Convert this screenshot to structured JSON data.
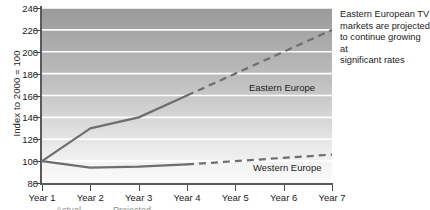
{
  "chart_data": {
    "type": "line",
    "title": "",
    "xlabel": "",
    "ylabel": "Index to 2000 = 100",
    "x": [
      "Year 1",
      "Year 2",
      "Year 3",
      "Year 4",
      "Year 5",
      "Year 6",
      "Year 7"
    ],
    "ylim": [
      80,
      240
    ],
    "yticks": [
      80,
      100,
      120,
      140,
      160,
      180,
      200,
      220,
      240
    ],
    "ytick_labels": [
      "80",
      "100",
      "120",
      "140",
      "160",
      "180",
      "200",
      "220",
      "240"
    ],
    "grid": "horizontal-white-gridlines",
    "legend": "inline-series-labels",
    "series": [
      {
        "name": "Eastern Europe",
        "values": [
          100,
          130,
          140,
          160,
          180,
          200,
          220
        ],
        "actual_through": "Year 4",
        "actual_values": [
          100,
          130,
          140,
          160
        ],
        "projected_values": [
          160,
          180,
          200,
          220
        ],
        "color": "#6e6e6e"
      },
      {
        "name": "Western Europe",
        "values": [
          100,
          94,
          95,
          97,
          100,
          103,
          106
        ],
        "actual_through": "Year 4",
        "actual_values": [
          100,
          94,
          95,
          97
        ],
        "projected_values": [
          97,
          100,
          103,
          106
        ],
        "color": "#6e6e6e"
      }
    ],
    "annotations": [
      {
        "name": "eastern-europe-projection-note",
        "text": "Eastern European TV markets are projected to continue growing at significant rates"
      }
    ]
  },
  "axis": {
    "y_title": "Index to 2000 = 100"
  },
  "annotation": {
    "line1": "Eastern European TV",
    "line2": "markets are projected",
    "line3": "to continue growing at",
    "line4": "significant rates"
  },
  "series_labels": {
    "eastern": "Eastern Europe",
    "western": "Western Europe"
  },
  "caption": {
    "clipped_text": "Actual  ———   Projected  – – –"
  }
}
